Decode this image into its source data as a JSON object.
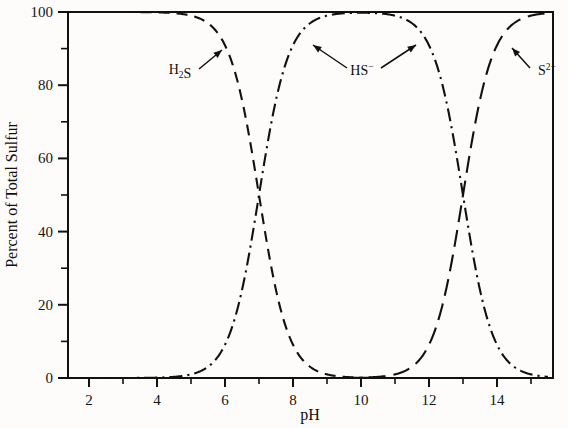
{
  "chart_data": {
    "type": "line",
    "title": "",
    "xlabel": "pH",
    "ylabel": "Percent of Total Sulfur",
    "xlim": [
      1,
      15.5
    ],
    "ylim": [
      0,
      100
    ],
    "grid": false,
    "legend_position": "inline-annotations",
    "x_ticks_major": [
      2,
      4,
      6,
      8,
      10,
      12,
      14
    ],
    "x_ticks_minor": [
      1,
      3,
      5,
      7,
      9,
      11,
      13,
      15
    ],
    "x_tick_labels": [
      "2",
      "4",
      "6",
      "8",
      "10",
      "12",
      "14"
    ],
    "y_ticks_major": [
      0,
      20,
      40,
      60,
      80,
      100
    ],
    "y_ticks_minor": [
      10,
      30,
      50,
      70,
      90
    ],
    "y_tick_labels": [
      "0",
      "20",
      "40",
      "60",
      "80",
      "100"
    ],
    "pk1": 7.0,
    "pk2": 13.0,
    "x": [
      1,
      1.5,
      2,
      2.5,
      3,
      3.5,
      4,
      4.5,
      5,
      5.5,
      6,
      6.25,
      6.5,
      6.75,
      7,
      7.25,
      7.5,
      7.75,
      8,
      8.5,
      9,
      9.5,
      10,
      10.5,
      11,
      11.5,
      12,
      12.25,
      12.5,
      12.75,
      13,
      13.25,
      13.5,
      13.75,
      14,
      14.5,
      15,
      15.5
    ],
    "series": [
      {
        "name": "H2S",
        "label": "H₂S",
        "dash": "dashed",
        "values": [
          100,
          100,
          100,
          100,
          99.99,
          99.97,
          99.9,
          99.68,
          99.01,
          96.93,
          90.91,
          84.98,
          75.97,
          64.01,
          50.0,
          35.99,
          24.03,
          15.02,
          9.09,
          3.07,
          0.99,
          0.32,
          0.1,
          0.03,
          0.01,
          0.003,
          0.001,
          0.0006,
          0.0003,
          0.0002,
          0.0001,
          0,
          0,
          0,
          0,
          0,
          0,
          0
        ]
      },
      {
        "name": "HS-",
        "label": "HS⁻",
        "dash": "dashdot",
        "values": [
          0,
          0,
          0.0001,
          0.0003,
          0.001,
          0.003,
          0.01,
          0.032,
          0.099,
          0.307,
          0.909,
          1.5,
          2.4,
          3.6,
          5.0,
          3.6,
          2.4,
          1.5,
          0.91,
          0.31,
          0.1,
          0.03,
          0.01,
          0.003,
          0.001,
          0.0003,
          0.0001,
          0,
          0,
          0,
          0,
          0,
          0,
          0,
          0,
          0,
          0,
          0
        ]
      },
      {
        "name": "S2-",
        "label": "S²⁻",
        "dash": "longdash",
        "values": [
          0,
          0,
          0,
          0,
          0,
          0,
          0,
          0,
          0,
          0,
          0,
          0,
          0,
          0,
          0,
          0,
          0,
          0,
          0,
          0,
          0.001,
          0.003,
          0.01,
          0.03,
          0.1,
          0.31,
          0.91,
          1.5,
          3.07,
          9.09,
          50.0,
          64.0,
          75.97,
          84.98,
          90.91,
          96.93,
          99.01,
          99.68
        ]
      }
    ],
    "annotations": [
      {
        "name": "h2s-annotation",
        "text": "H₂S",
        "x_label": 8.0,
        "y_label": 86.0,
        "x_tip": 10.2,
        "y_tip": 94.5
      },
      {
        "name": "hs-annotation",
        "text": "HS⁻",
        "x_label": 14.5,
        "y_label": 86.5,
        "x_tip_left": 11.8,
        "y_tip_left": 95.5,
        "x_tip_right": 17.4,
        "y_tip_right": 95.5
      },
      {
        "name": "s2-annotation",
        "text": "S²⁻",
        "x_label": 21.2,
        "y_label": 86.0,
        "x_tip": 19.4,
        "y_tip": 94.5
      }
    ]
  },
  "axes": {
    "y_title": "Percent of Total Sulfur",
    "x_title": "pH"
  },
  "colors": {
    "line": "#111111",
    "axis": "#111111",
    "background": "#fdfcfa"
  }
}
